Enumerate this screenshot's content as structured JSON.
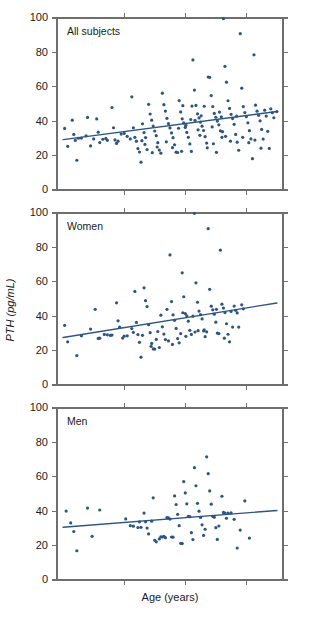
{
  "figure": {
    "xlabel": "Age (years)",
    "ylabel": "PTH (pg/mL)",
    "marker_color": "#2d5580",
    "line_color": "#2d5580",
    "axis_color": "#6e6e6e"
  },
  "chart_data": [
    {
      "type": "scatter",
      "title": "All subjects",
      "xlabel": "Age (years)",
      "ylabel": "PTH (pg/mL)",
      "xlim": [
        18,
        92
      ],
      "ylim": [
        0,
        100
      ],
      "yticks": [
        0,
        20,
        40,
        60,
        80,
        100
      ],
      "xticks": [
        40,
        60,
        80
      ],
      "xtick_labels": [
        "",
        "",
        ""
      ],
      "grid": false,
      "legend": "none",
      "annotation": "All subjects",
      "fit_line": {
        "x": [
          20,
          90
        ],
        "y": [
          29.3,
          45.6
        ]
      },
      "points": [
        [
          20.5,
          35.8
        ],
        [
          21.5,
          25.4
        ],
        [
          23.0,
          40.6
        ],
        [
          23.5,
          32.3
        ],
        [
          24.0,
          28.8
        ],
        [
          24.5,
          17.3
        ],
        [
          26.0,
          30.2
        ],
        [
          28.0,
          42.2
        ],
        [
          29.0,
          25.6
        ],
        [
          30.0,
          29.7
        ],
        [
          31.0,
          41.3
        ],
        [
          31.5,
          33.6
        ],
        [
          32.0,
          27.6
        ],
        [
          33.0,
          29.5
        ],
        [
          34.5,
          28.9
        ],
        [
          36.0,
          47.9
        ],
        [
          36.5,
          36.2
        ],
        [
          37.0,
          29.1
        ],
        [
          37.5,
          27.1
        ],
        [
          39.0,
          32.5
        ],
        [
          40.0,
          32.9
        ],
        [
          41.0,
          31.2
        ],
        [
          42.5,
          54.2
        ],
        [
          43.0,
          36.2
        ],
        [
          43.5,
          30.6
        ],
        [
          44.0,
          28.4
        ],
        [
          44.5,
          24.1
        ],
        [
          45.0,
          22.1
        ],
        [
          45.5,
          16.2
        ],
        [
          46.0,
          38.5
        ],
        [
          46.5,
          33.4
        ],
        [
          47.0,
          30.5
        ],
        [
          47.5,
          23.5
        ],
        [
          48.0,
          49.8
        ],
        [
          48.5,
          44.2
        ],
        [
          49.0,
          40.6
        ],
        [
          49.5,
          37.2
        ],
        [
          50.0,
          34.3
        ],
        [
          50.5,
          31.6
        ],
        [
          51.0,
          27.5
        ],
        [
          51.5,
          23.2
        ],
        [
          52.0,
          21.4
        ],
        [
          52.5,
          56.3
        ],
        [
          53.0,
          49.6
        ],
        [
          53.5,
          45.9
        ],
        [
          54.0,
          41.7
        ],
        [
          54.5,
          38.6
        ],
        [
          55.0,
          36.1
        ],
        [
          55.5,
          33.2
        ],
        [
          56.0,
          30.4
        ],
        [
          56.5,
          26.3
        ],
        [
          57.0,
          22.0
        ],
        [
          57.5,
          21.8
        ],
        [
          58.0,
          52.0
        ],
        [
          58.5,
          45.4
        ],
        [
          59.0,
          41.4
        ],
        [
          59.5,
          39.0
        ],
        [
          60.0,
          36.4
        ],
        [
          60.5,
          33.5
        ],
        [
          61.0,
          30.6
        ],
        [
          61.5,
          26.8
        ],
        [
          62.0,
          22.4
        ],
        [
          62.5,
          75.6
        ],
        [
          63.0,
          58.1
        ],
        [
          63.5,
          49.2
        ],
        [
          64.0,
          44.3
        ],
        [
          64.5,
          41.9
        ],
        [
          65.0,
          39.5
        ],
        [
          65.5,
          37.1
        ],
        [
          66.0,
          34.6
        ],
        [
          66.5,
          31.0
        ],
        [
          67.0,
          27.3
        ],
        [
          67.5,
          65.7
        ],
        [
          68.0,
          65.5
        ],
        [
          68.5,
          54.9
        ],
        [
          69.0,
          48.5
        ],
        [
          69.5,
          44.5
        ],
        [
          70.0,
          42.3
        ],
        [
          70.5,
          40.1
        ],
        [
          71.0,
          37.9
        ],
        [
          71.5,
          34.4
        ],
        [
          72.0,
          30.6
        ],
        [
          72.5,
          99.6
        ],
        [
          73.0,
          71.9
        ],
        [
          73.5,
          62.7
        ],
        [
          74.0,
          51.9
        ],
        [
          74.5,
          47.4
        ],
        [
          75.0,
          44.0
        ],
        [
          75.5,
          41.5
        ],
        [
          76.0,
          38.2
        ],
        [
          76.5,
          32.3
        ],
        [
          77.0,
          27.8
        ],
        [
          77.5,
          23.1
        ],
        [
          78.0,
          90.9
        ],
        [
          78.5,
          59.2
        ],
        [
          79.0,
          48.5
        ],
        [
          79.5,
          45.0
        ],
        [
          80.0,
          42.6
        ],
        [
          80.5,
          39.1
        ],
        [
          81.0,
          34.5
        ],
        [
          81.5,
          29.7
        ],
        [
          82.0,
          18.2
        ],
        [
          82.5,
          78.6
        ],
        [
          83.0,
          49.3
        ],
        [
          83.5,
          45.8
        ],
        [
          84.0,
          43.4
        ],
        [
          84.5,
          40.2
        ],
        [
          85.0,
          35.2
        ],
        [
          85.5,
          29.6
        ],
        [
          86.0,
          46.4
        ],
        [
          86.5,
          43.0
        ],
        [
          87.0,
          34.1
        ],
        [
          87.5,
          24.2
        ],
        [
          88.0,
          47.2
        ],
        [
          88.5,
          44.9
        ],
        [
          89.0,
          42.0
        ],
        [
          90.0,
          45.6
        ],
        [
          25.0,
          30.1
        ],
        [
          27.5,
          31.5
        ],
        [
          34.0,
          30.0
        ],
        [
          38.0,
          28.4
        ],
        [
          42.0,
          29.7
        ],
        [
          46.8,
          26.5
        ],
        [
          50.8,
          25.0
        ],
        [
          53.8,
          28.0
        ],
        [
          57.8,
          35.9
        ],
        [
          61.8,
          41.0
        ],
        [
          64.8,
          31.8
        ],
        [
          68.8,
          36.7
        ],
        [
          71.8,
          42.5
        ],
        [
          74.8,
          28.4
        ],
        [
          78.8,
          30.6
        ],
        [
          82.8,
          29.0
        ],
        [
          59.2,
          49.0
        ],
        [
          62.2,
          48.8
        ],
        [
          63.2,
          40.5
        ],
        [
          66.2,
          48.7
        ],
        [
          69.2,
          26.9
        ],
        [
          70.2,
          21.9
        ],
        [
          73.2,
          31.2
        ],
        [
          45.8,
          28.7
        ],
        [
          49.2,
          21.7
        ],
        [
          55.8,
          24.6
        ],
        [
          58.8,
          22.5
        ],
        [
          67.2,
          24.5
        ],
        [
          76.8,
          42.9
        ],
        [
          80.8,
          27.5
        ],
        [
          84.8,
          24.3
        ],
        [
          60.2,
          37.6
        ],
        [
          64.2,
          35.0
        ],
        [
          65.2,
          43.1
        ],
        [
          71.2,
          45.3
        ],
        [
          72.2,
          33.9
        ]
      ]
    },
    {
      "type": "scatter",
      "title": "Women",
      "xlabel": "Age (years)",
      "ylabel": "PTH (pg/mL)",
      "xlim": [
        18,
        92
      ],
      "ylim": [
        0,
        100
      ],
      "yticks": [
        0,
        20,
        40,
        60,
        80,
        100
      ],
      "xticks": [
        40,
        60,
        80
      ],
      "xtick_labels": [
        "",
        "",
        ""
      ],
      "grid": false,
      "legend": "none",
      "annotation": "Women",
      "fit_line": {
        "x": [
          20,
          90
        ],
        "y": [
          27.6,
          47.7
        ]
      },
      "points": [
        [
          20.5,
          34.7
        ],
        [
          21.5,
          25.1
        ],
        [
          24.5,
          17.1
        ],
        [
          26.0,
          28.6
        ],
        [
          29.0,
          32.5
        ],
        [
          30.5,
          44.0
        ],
        [
          31.5,
          27.1
        ],
        [
          33.5,
          29.4
        ],
        [
          34.5,
          29.2
        ],
        [
          36.0,
          29.0
        ],
        [
          37.5,
          47.8
        ],
        [
          38.0,
          37.3
        ],
        [
          38.5,
          33.6
        ],
        [
          39.5,
          27.3
        ],
        [
          42.5,
          32.8
        ],
        [
          43.5,
          54.4
        ],
        [
          44.0,
          36.4
        ],
        [
          44.5,
          29.3
        ],
        [
          45.0,
          24.8
        ],
        [
          45.5,
          16.2
        ],
        [
          46.5,
          56.5
        ],
        [
          47.0,
          49.0
        ],
        [
          47.5,
          45.6
        ],
        [
          48.0,
          35.1
        ],
        [
          48.5,
          30.4
        ],
        [
          49.0,
          24.2
        ],
        [
          49.5,
          21.0
        ],
        [
          50.0,
          20.9
        ],
        [
          52.0,
          40.6
        ],
        [
          52.5,
          33.8
        ],
        [
          53.0,
          29.6
        ],
        [
          53.5,
          26.4
        ],
        [
          55.0,
          75.6
        ],
        [
          55.5,
          48.5
        ],
        [
          56.0,
          40.8
        ],
        [
          56.5,
          37.6
        ],
        [
          57.0,
          32.9
        ],
        [
          57.5,
          27.0
        ],
        [
          58.0,
          24.5
        ],
        [
          59.0,
          65.2
        ],
        [
          59.5,
          51.3
        ],
        [
          60.0,
          41.5
        ],
        [
          60.5,
          40.2
        ],
        [
          61.0,
          37.1
        ],
        [
          61.5,
          31.8
        ],
        [
          62.0,
          29.4
        ],
        [
          63.0,
          99.8
        ],
        [
          63.5,
          59.4
        ],
        [
          64.0,
          48.1
        ],
        [
          64.5,
          43.0
        ],
        [
          65.0,
          40.9
        ],
        [
          65.5,
          38.4
        ],
        [
          66.0,
          31.4
        ],
        [
          66.5,
          28.1
        ],
        [
          67.5,
          90.9
        ],
        [
          68.0,
          55.6
        ],
        [
          68.5,
          45.8
        ],
        [
          69.0,
          43.7
        ],
        [
          69.5,
          41.2
        ],
        [
          70.0,
          36.5
        ],
        [
          70.5,
          30.2
        ],
        [
          71.5,
          78.4
        ],
        [
          72.0,
          47.0
        ],
        [
          72.5,
          44.7
        ],
        [
          73.0,
          42.1
        ],
        [
          73.5,
          35.6
        ],
        [
          74.0,
          29.5
        ],
        [
          74.5,
          25.1
        ],
        [
          76.0,
          45.9
        ],
        [
          76.5,
          43.4
        ],
        [
          77.0,
          41.9
        ],
        [
          77.5,
          33.7
        ],
        [
          78.5,
          46.6
        ],
        [
          79.0,
          44.3
        ],
        [
          51.0,
          31.1
        ],
        [
          54.0,
          44.0
        ],
        [
          58.5,
          29.9
        ],
        [
          62.5,
          40.0
        ],
        [
          67.0,
          30.9
        ],
        [
          71.0,
          29.9
        ],
        [
          75.0,
          42.8
        ],
        [
          41.0,
          28.6
        ],
        [
          40.0,
          28.4
        ],
        [
          35.5,
          28.8
        ],
        [
          32.0,
          27.2
        ],
        [
          43.0,
          30.6
        ],
        [
          46.0,
          28.9
        ],
        [
          50.5,
          26.5
        ],
        [
          54.5,
          25.6
        ],
        [
          59.2,
          42.0
        ],
        [
          63.2,
          30.8
        ],
        [
          66.2,
          32.0
        ],
        [
          70.2,
          44.0
        ],
        [
          75.5,
          33.7
        ],
        [
          48.8,
          22.5
        ],
        [
          51.5,
          21.8
        ],
        [
          55.8,
          23.6
        ],
        [
          60.2,
          28.3
        ],
        [
          64.2,
          31.6
        ],
        [
          72.8,
          27.2
        ]
      ]
    },
    {
      "type": "scatter",
      "title": "Men",
      "xlabel": "Age (years)",
      "ylabel": "PTH (pg/mL)",
      "xlim": [
        18,
        92
      ],
      "ylim": [
        0,
        100
      ],
      "yticks": [
        0,
        20,
        40,
        60,
        80,
        100
      ],
      "xticks": [
        40,
        60,
        80
      ],
      "xtick_labels": [
        "",
        "",
        ""
      ],
      "grid": false,
      "legend": "none",
      "annotation": "Men",
      "fit_line": {
        "x": [
          20,
          90
        ],
        "y": [
          30.7,
          40.4
        ]
      },
      "points": [
        [
          21.0,
          40.1
        ],
        [
          22.5,
          33.2
        ],
        [
          23.5,
          28.2
        ],
        [
          24.5,
          17.0
        ],
        [
          28.0,
          41.8
        ],
        [
          29.5,
          25.4
        ],
        [
          32.0,
          40.7
        ],
        [
          40.5,
          35.5
        ],
        [
          42.0,
          31.6
        ],
        [
          43.0,
          31.3
        ],
        [
          44.5,
          30.5
        ],
        [
          45.5,
          30.6
        ],
        [
          46.5,
          38.9
        ],
        [
          47.0,
          33.8
        ],
        [
          47.5,
          30.2
        ],
        [
          48.0,
          26.8
        ],
        [
          49.5,
          47.8
        ],
        [
          50.0,
          23.1
        ],
        [
          50.5,
          22.2
        ],
        [
          52.0,
          25.1
        ],
        [
          52.5,
          25.0
        ],
        [
          53.5,
          24.6
        ],
        [
          54.0,
          36.3
        ],
        [
          54.5,
          36.1
        ],
        [
          55.0,
          35.4
        ],
        [
          55.5,
          25.0
        ],
        [
          56.0,
          24.9
        ],
        [
          57.0,
          43.9
        ],
        [
          57.5,
          38.2
        ],
        [
          58.0,
          31.6
        ],
        [
          58.5,
          21.3
        ],
        [
          59.0,
          21.2
        ],
        [
          59.5,
          57.2
        ],
        [
          60.0,
          50.6
        ],
        [
          60.5,
          44.3
        ],
        [
          61.0,
          37.0
        ],
        [
          61.5,
          36.8
        ],
        [
          62.0,
          27.5
        ],
        [
          62.5,
          23.5
        ],
        [
          63.0,
          65.3
        ],
        [
          63.5,
          54.8
        ],
        [
          64.0,
          44.6
        ],
        [
          64.5,
          40.0
        ],
        [
          65.0,
          36.4
        ],
        [
          65.5,
          32.1
        ],
        [
          66.0,
          25.9
        ],
        [
          67.0,
          71.6
        ],
        [
          67.5,
          61.8
        ],
        [
          68.0,
          51.8
        ],
        [
          68.5,
          44.1
        ],
        [
          69.0,
          37.0
        ],
        [
          69.5,
          36.5
        ],
        [
          70.0,
          30.4
        ],
        [
          70.5,
          23.6
        ],
        [
          72.0,
          48.7
        ],
        [
          72.5,
          39.3
        ],
        [
          73.0,
          38.9
        ],
        [
          74.0,
          38.9
        ],
        [
          75.0,
          39.0
        ],
        [
          76.0,
          35.3
        ],
        [
          77.0,
          18.6
        ],
        [
          78.0,
          29.0
        ],
        [
          79.5,
          46.0
        ],
        [
          81.0,
          24.4
        ],
        [
          56.5,
          48.9
        ],
        [
          53.0,
          25.4
        ],
        [
          51.5,
          23.9
        ],
        [
          66.5,
          29.5
        ],
        [
          71.0,
          31.4
        ],
        [
          73.5,
          35.9
        ],
        [
          45.0,
          33.8
        ],
        [
          49.0,
          34.2
        ]
      ]
    }
  ]
}
